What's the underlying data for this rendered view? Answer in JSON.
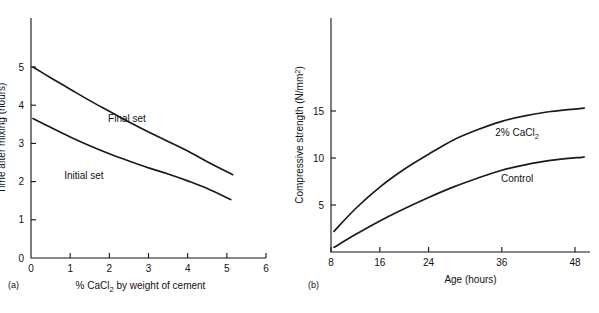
{
  "figure": {
    "panel_a_caption": "(a)",
    "panel_b_caption": "(b)"
  },
  "chart_data": [
    {
      "id": "a",
      "type": "line",
      "title": "",
      "xlabel": "% CaCl2 by weight of cement",
      "xlabel_parts": {
        "pre": "% CaCl",
        "sub": "2",
        "post": " by weight of cement"
      },
      "ylabel": "Time after mixing (hours)",
      "xlim": [
        0,
        6
      ],
      "ylim": [
        0,
        5.6
      ],
      "xticks": [
        0,
        1,
        2,
        3,
        4,
        5,
        6
      ],
      "xticklabels": [
        "0",
        "1",
        "2",
        "3",
        "4",
        "5",
        "6"
      ],
      "yticks": [
        0,
        1,
        2,
        3,
        4,
        5
      ],
      "yticklabels": [
        "0",
        "1",
        "2",
        "3",
        "4",
        "5"
      ],
      "grid": false,
      "legend_position": "inline-labels",
      "series": [
        {
          "name": "Final set",
          "label": "Final set",
          "label_x": 2.45,
          "label_y": 3.55,
          "x": [
            0.05,
            0.5,
            1.0,
            1.5,
            2.0,
            2.5,
            3.0,
            3.5,
            4.0,
            4.5,
            5.15
          ],
          "y": [
            5.0,
            4.72,
            4.42,
            4.12,
            3.84,
            3.56,
            3.3,
            3.05,
            2.8,
            2.52,
            2.18
          ]
        },
        {
          "name": "Initial set",
          "label": "Initial set",
          "label_x": 1.35,
          "label_y": 2.08,
          "x": [
            0.05,
            0.5,
            1.0,
            1.5,
            2.0,
            2.5,
            3.0,
            3.5,
            4.0,
            4.5,
            5.1
          ],
          "y": [
            3.65,
            3.42,
            3.17,
            2.94,
            2.73,
            2.54,
            2.36,
            2.2,
            2.02,
            1.82,
            1.53
          ]
        }
      ]
    },
    {
      "id": "b",
      "type": "line",
      "title": "",
      "xlabel": "Age (hours)",
      "ylabel": "Compressive strength (N/mm2)",
      "ylabel_parts": {
        "pre": "Compressive strength (N/mm",
        "sup": "2",
        "post": ")"
      },
      "xlim": [
        8,
        50
      ],
      "ylim": [
        0,
        25
      ],
      "xticks": [
        8,
        16,
        24,
        36,
        48
      ],
      "xticklabels": [
        "8",
        "16",
        "24",
        "36",
        "48"
      ],
      "yticks": [
        5,
        10,
        15
      ],
      "yticklabels": [
        "5",
        "10",
        "15"
      ],
      "grid": false,
      "legend_position": "inline-labels",
      "series": [
        {
          "name": "2% CaCl2",
          "label": "2% CaCl2",
          "label_parts": {
            "pre": "2% CaCl",
            "sub": "2",
            "post": ""
          },
          "label_x": 38.5,
          "label_y": 12.3,
          "x": [
            8.5,
            12,
            16,
            20,
            24,
            28,
            32,
            36,
            40,
            44,
            49.5
          ],
          "y": [
            2.2,
            4.6,
            6.9,
            8.8,
            10.4,
            11.9,
            13.0,
            13.9,
            14.5,
            14.95,
            15.3
          ]
        },
        {
          "name": "Control",
          "label": "Control",
          "label_x": 38.5,
          "label_y": 7.4,
          "x": [
            8.5,
            12,
            16,
            20,
            24,
            28,
            32,
            36,
            40,
            44,
            49.5
          ],
          "y": [
            0.5,
            1.85,
            3.3,
            4.6,
            5.8,
            6.9,
            7.85,
            8.7,
            9.3,
            9.75,
            10.1
          ]
        }
      ]
    }
  ]
}
